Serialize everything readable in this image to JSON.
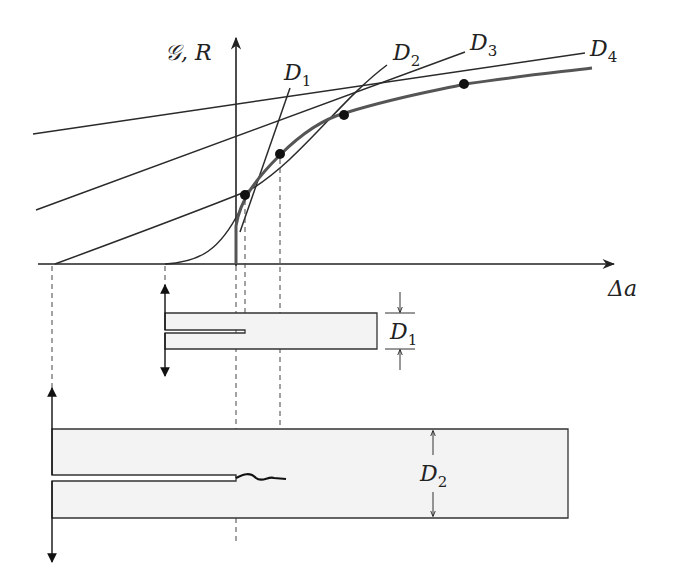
{
  "colors": {
    "line": "#2a2a2a",
    "r_curve": "#555555",
    "specimen_fill": "#f3f3f3",
    "dash": "#444444"
  },
  "axes": {
    "y_label_main": "𝒢, R",
    "x_label_main": "Δa"
  },
  "lines": [
    {
      "id": "D1",
      "label": "D",
      "subscript": "1"
    },
    {
      "id": "D2",
      "label": "D",
      "subscript": "2"
    },
    {
      "id": "D3",
      "label": "D",
      "subscript": "3"
    },
    {
      "id": "D4",
      "label": "D",
      "subscript": "4"
    }
  ],
  "specimens": [
    {
      "id": "small",
      "dimension_label": "D",
      "dimension_subscript": "1"
    },
    {
      "id": "large",
      "dimension_label": "D",
      "dimension_subscript": "2"
    }
  ],
  "tangent_points": 4
}
